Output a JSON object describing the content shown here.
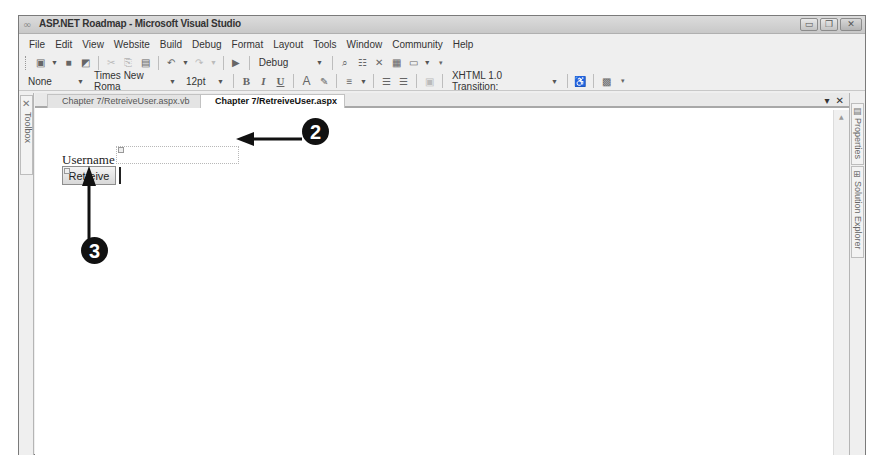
{
  "window": {
    "title": "ASP.NET Roadmap - Microsoft Visual Studio",
    "controls": {
      "minimize": "▭",
      "maximize": "❐",
      "close": "✕"
    }
  },
  "menubar": {
    "items": [
      "File",
      "Edit",
      "View",
      "Website",
      "Build",
      "Debug",
      "Format",
      "Layout",
      "Tools",
      "Window",
      "Community",
      "Help"
    ]
  },
  "toolbar_standard": {
    "solution_config": "Debug",
    "icons": [
      "new-project-icon",
      "save-icon",
      "save-all-icon",
      "cut-icon",
      "copy-icon",
      "paste-icon",
      "undo-icon",
      "redo-icon",
      "start-debug-icon",
      "find-icon",
      "properties-icon",
      "toolbox-icon",
      "object-browser-icon",
      "window-icon"
    ]
  },
  "toolbar_formatting": {
    "block_format": "None",
    "font_name": "Times New Roma",
    "font_size": "12pt",
    "bold": "B",
    "italic": "I",
    "underline": "U",
    "doctype": "XHTML 1.0 Transition:"
  },
  "left_panel": {
    "toolbox_label": "Toolbox"
  },
  "right_panel": {
    "properties_label": "Properties",
    "solution_explorer_label": "Solution Explorer"
  },
  "tabs": [
    {
      "label": "Chapter 7/RetreiveUser.aspx.vb",
      "active": false
    },
    {
      "label": "Chapter 7/RetreiveUser.aspx",
      "active": true
    }
  ],
  "tab_controls": {
    "dropdown": "▾",
    "close": "✕"
  },
  "design": {
    "username_label": "Username",
    "username_value": "",
    "retrieve_button_label": "Retreive"
  },
  "callouts": {
    "step2": "2",
    "step3": "3"
  }
}
